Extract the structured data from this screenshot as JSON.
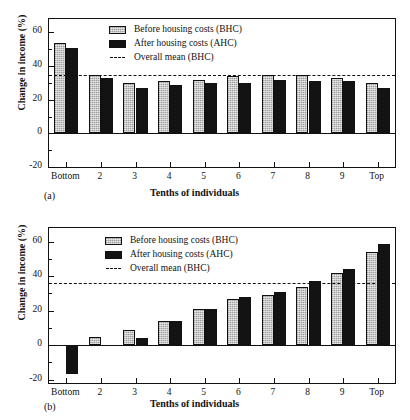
{
  "figures": [
    {
      "panel_label": "(a)",
      "legend": [
        {
          "key": "bhc",
          "label": "Before housing costs (BHC)"
        },
        {
          "key": "ahc",
          "label": "After housing costs (AHC)"
        },
        {
          "key": "mean",
          "label": "Overall mean (BHC)"
        }
      ]
    },
    {
      "panel_label": "(b)",
      "legend": [
        {
          "key": "bhc",
          "label": "Before housing costs (BHC)"
        },
        {
          "key": "ahc",
          "label": "After housing costs (AHC)"
        },
        {
          "key": "mean",
          "label": "Overall mean (BHC)"
        }
      ]
    }
  ],
  "chart_data": [
    {
      "type": "bar",
      "panel": "(a)",
      "title": "",
      "xlabel": "Tenths of individuals",
      "ylabel": "Change in income (%)",
      "categories": [
        "Bottom",
        "2",
        "3",
        "4",
        "5",
        "6",
        "7",
        "8",
        "9",
        "Top"
      ],
      "series": [
        {
          "name": "Before housing costs (BHC)",
          "values": [
            54,
            35,
            30,
            31,
            32,
            34,
            35,
            35,
            33,
            30
          ]
        },
        {
          "name": "After housing costs (AHC)",
          "values": [
            51,
            33,
            27,
            29,
            30,
            30,
            32,
            31,
            31,
            27
          ]
        }
      ],
      "annotations": [
        {
          "type": "hline",
          "name": "Overall mean (BHC)",
          "value": 35,
          "style": "dashed"
        }
      ],
      "ylim": [
        -20,
        68
      ],
      "yticks": [
        -20,
        0,
        20,
        40,
        60
      ],
      "ytick_labels": [
        "-20",
        "0",
        "20",
        "40",
        "60"
      ],
      "yminor": [
        -10,
        10,
        30,
        50
      ],
      "grid": false,
      "legend_position": "top-center"
    },
    {
      "type": "bar",
      "panel": "(b)",
      "title": "",
      "xlabel": "Tenths of individuals",
      "ylabel": "Change in income (%)",
      "categories": [
        "Bottom",
        "2",
        "3",
        "4",
        "5",
        "6",
        "7",
        "8",
        "9",
        "Top"
      ],
      "series": [
        {
          "name": "Before housing costs (BHC)",
          "values": [
            0,
            5,
            9,
            14,
            21,
            27,
            29,
            34,
            42,
            54
          ]
        },
        {
          "name": "After housing costs (AHC)",
          "values": [
            -17,
            0,
            4,
            14,
            21,
            28,
            31,
            37,
            44,
            59
          ]
        }
      ],
      "annotations": [
        {
          "type": "hline",
          "name": "Overall mean (BHC)",
          "value": 36,
          "style": "dashed"
        }
      ],
      "ylim": [
        -22,
        68
      ],
      "yticks": [
        -20,
        0,
        20,
        40,
        60
      ],
      "ytick_labels": [
        "-20",
        "0",
        "20",
        "40",
        "60"
      ],
      "yminor": [
        -10,
        10,
        30,
        50
      ],
      "grid": false,
      "legend_position": "top-center"
    }
  ],
  "colors": {
    "bhc_fill": "#b8b8b8",
    "ahc_fill": "#131313",
    "axis": "#111111",
    "background": "#ffffff"
  }
}
